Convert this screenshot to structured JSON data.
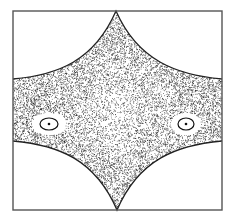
{
  "chart_data": {
    "type": "scatter",
    "title": "",
    "xlabel": "",
    "ylabel": "",
    "frame": {
      "x": 13,
      "y": 11,
      "width": 209,
      "height": 199,
      "stroke": "#555555"
    },
    "boundary": {
      "top_cusp": [
        116,
        11
      ],
      "bottom_cusp": [
        117,
        210
      ],
      "left_top": [
        13,
        79
      ],
      "left_bottom": [
        13,
        141
      ],
      "right_top": [
        222,
        79
      ],
      "right_bottom": [
        222,
        141
      ],
      "stroke": "#222222"
    },
    "islands": [
      {
        "name": "left-island",
        "cx": 49,
        "cy": 124,
        "rx": 9,
        "ry": 6,
        "center_dot": true
      },
      {
        "name": "right-island",
        "cx": 186,
        "cy": 124,
        "rx": 8,
        "ry": 6,
        "center_dot": true
      }
    ],
    "points": {
      "count": 9000,
      "seed": 7,
      "color": "#1a1a1a",
      "radius": 0.45
    },
    "grid": false,
    "legend": null
  }
}
